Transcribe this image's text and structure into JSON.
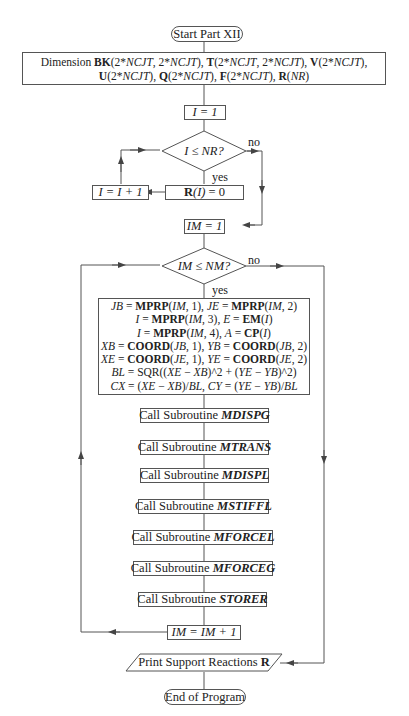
{
  "flowchart": {
    "start": "Start Part XII",
    "dimension": {
      "prefix": "Dimension",
      "line1": [
        {
          "b": "BK"
        },
        {
          "t": "(2*"
        },
        {
          "i": "NCJT"
        },
        {
          "t": ", 2*"
        },
        {
          "i": "NCJT"
        },
        {
          "t": "), "
        },
        {
          "b": "T"
        },
        {
          "t": "(2*"
        },
        {
          "i": "NCJT"
        },
        {
          "t": ", 2*"
        },
        {
          "i": "NCJT"
        },
        {
          "t": "), "
        },
        {
          "b": "V"
        },
        {
          "t": "(2*"
        },
        {
          "i": "NCJT"
        },
        {
          "t": "),"
        }
      ],
      "line2": [
        {
          "b": "U"
        },
        {
          "t": "(2*"
        },
        {
          "i": "NCJT"
        },
        {
          "t": "), "
        },
        {
          "b": "Q"
        },
        {
          "t": "(2*"
        },
        {
          "i": "NCJT"
        },
        {
          "t": "), "
        },
        {
          "b": "F"
        },
        {
          "t": "(2*"
        },
        {
          "i": "NCJT"
        },
        {
          "t": "), "
        },
        {
          "b": "R"
        },
        {
          "t": "("
        },
        {
          "i": "NR"
        },
        {
          "t": ")"
        }
      ]
    },
    "init_i": "I = 1",
    "decision_i": "I ≤ NR?",
    "decision_i_no": "no",
    "decision_i_yes": "yes",
    "set_r": "R(I) = 0",
    "increment_i": "I = I + 1",
    "init_im": "IM = 1",
    "decision_im": "IM ≤ NM?",
    "decision_im_no": "no",
    "decision_im_yes": "yes",
    "member_block": [
      "JB = MPRP(IM, 1), JE = MPRP(IM, 2)",
      "I = MPRP(IM, 3), E = EM(I)",
      "I = MPRP(IM, 4), A = CP(I)",
      "XB = COORD(JB, 1), YB = COORD(JB, 2)",
      "XE = COORD(JE, 1), YE = COORD(JE, 2)",
      "BL = SQR((XE − XB)^2 + (YE − YB)^2)",
      "CX = (XE − XB)/BL, CY = (YE − YB)/BL"
    ],
    "call_prefix": "Call Subroutine",
    "subroutines": [
      "MDISPG",
      "MTRANS",
      "MDISPL",
      "MSTIFFL",
      "MFORCEL",
      "MFORCEG",
      "STORER"
    ],
    "increment_im": "IM = IM + 1",
    "print": {
      "text": "Print Support Reactions",
      "bold": "R"
    },
    "end": "End of Program"
  },
  "colors": {
    "line": "#555555",
    "background": "#ffffff",
    "text": "#222222"
  }
}
